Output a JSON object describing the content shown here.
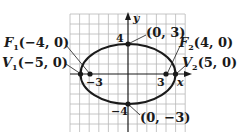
{
  "diagram": {
    "type": "ellipse-graph",
    "equation_params": {
      "a": 5,
      "b": 3,
      "c": 4,
      "center": [
        0,
        0
      ]
    },
    "axes": {
      "x_label": "x",
      "y_label": "y"
    },
    "ticks": {
      "x_neg": "−3",
      "x_pos": "3",
      "y_pos": "4",
      "y_neg": "−4"
    },
    "points": {
      "F1": {
        "letter": "F",
        "sub": "1",
        "coords": "(−4, 0)",
        "x": -4,
        "y": 0
      },
      "V1": {
        "letter": "V",
        "sub": "1",
        "coords": "(−5, 0)",
        "x": -5,
        "y": 0
      },
      "F2": {
        "letter": "F",
        "sub": "2",
        "coords": "(4, 0)",
        "x": 4,
        "y": 0
      },
      "V2": {
        "letter": "V",
        "sub": "2",
        "coords": "(5, 0)",
        "x": 5,
        "y": 0
      },
      "top": {
        "coords": "(0, 3)",
        "x": 0,
        "y": 3
      },
      "bottom": {
        "coords": "(0, −3)",
        "x": 0,
        "y": -3
      }
    },
    "colors": {
      "ink": "#1a1a1a",
      "grid": "#b8b8b8",
      "background": "#ffffff"
    }
  }
}
